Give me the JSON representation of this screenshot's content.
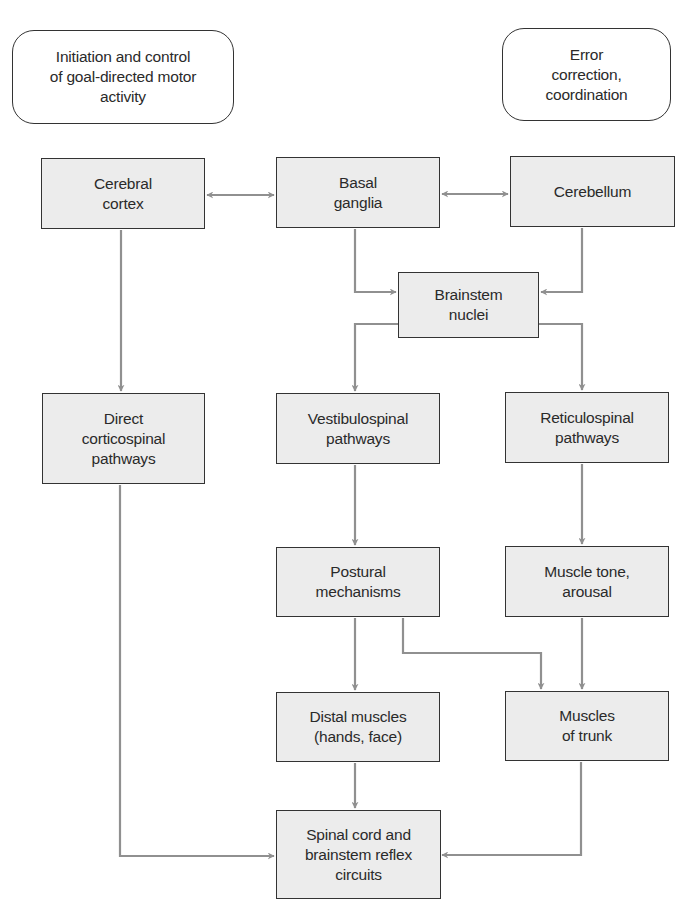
{
  "diagram": {
    "style": {
      "box_fill": "#ececec",
      "box_border": "#333333",
      "arrow_color": "#909090",
      "background": "#ffffff"
    },
    "annotations": [
      {
        "id": "goal",
        "text": "Initiation and control\nof goal-directed motor\nactivity"
      },
      {
        "id": "error",
        "text": "Error\ncorrection,\ncoordination"
      }
    ],
    "nodes": [
      {
        "id": "cerebral_cortex",
        "text": "Cerebral\ncortex"
      },
      {
        "id": "basal_ganglia",
        "text": "Basal\nganglia"
      },
      {
        "id": "cerebellum",
        "text": "Cerebellum"
      },
      {
        "id": "brainstem_nuclei",
        "text": "Brainstem\nnuclei"
      },
      {
        "id": "direct_corticospinal",
        "text": "Direct\ncorticospinal\npathways"
      },
      {
        "id": "vestibulospinal",
        "text": "Vestibulospinal\npathways"
      },
      {
        "id": "reticulospinal",
        "text": "Reticulospinal\npathways"
      },
      {
        "id": "postural",
        "text": "Postural\nmechanisms"
      },
      {
        "id": "muscle_tone",
        "text": "Muscle tone,\narousal"
      },
      {
        "id": "distal_muscles",
        "text": "Distal muscles\n(hands, face)"
      },
      {
        "id": "muscles_trunk",
        "text": "Muscles\nof trunk"
      },
      {
        "id": "spinal_cord",
        "text": "Spinal cord and\nbrainstem reflex\ncircuits"
      }
    ],
    "edges": [
      {
        "from": "cerebral_cortex",
        "to": "basal_ganglia",
        "bidirectional": true
      },
      {
        "from": "basal_ganglia",
        "to": "cerebellum",
        "bidirectional": true
      },
      {
        "from": "basal_ganglia",
        "to": "brainstem_nuclei"
      },
      {
        "from": "cerebellum",
        "to": "brainstem_nuclei"
      },
      {
        "from": "cerebral_cortex",
        "to": "direct_corticospinal"
      },
      {
        "from": "brainstem_nuclei",
        "to": "vestibulospinal"
      },
      {
        "from": "brainstem_nuclei",
        "to": "reticulospinal"
      },
      {
        "from": "vestibulospinal",
        "to": "postural"
      },
      {
        "from": "reticulospinal",
        "to": "muscle_tone"
      },
      {
        "from": "postural",
        "to": "distal_muscles"
      },
      {
        "from": "postural",
        "to": "muscles_trunk"
      },
      {
        "from": "muscle_tone",
        "to": "muscles_trunk"
      },
      {
        "from": "distal_muscles",
        "to": "spinal_cord"
      },
      {
        "from": "direct_corticospinal",
        "to": "spinal_cord"
      },
      {
        "from": "muscles_trunk",
        "to": "spinal_cord"
      }
    ]
  }
}
